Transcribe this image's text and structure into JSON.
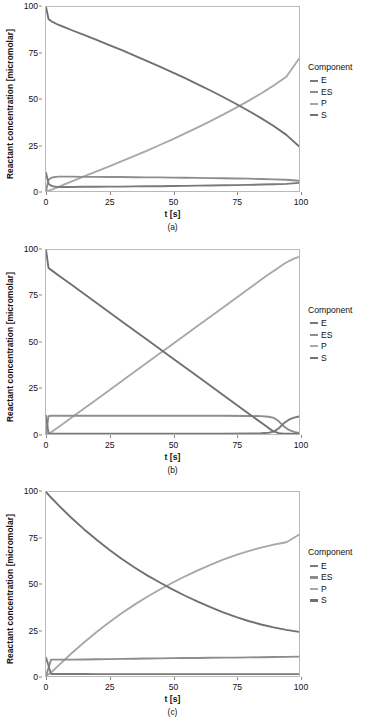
{
  "figure": {
    "panels": [
      {
        "caption": "(a)",
        "xlabel": "t [s]",
        "ylabel": "Reactant concentration [micromolar]",
        "xticks": [
          "0",
          "25",
          "50",
          "75",
          "100"
        ],
        "yticks": [
          "0",
          "25",
          "50",
          "75",
          "100"
        ],
        "legend": {
          "title": "Component",
          "items": [
            {
              "label": "E",
              "color": "#7a7a7a"
            },
            {
              "label": "ES",
              "color": "#8d8d8d"
            },
            {
              "label": "P",
              "color": "#a8a8a8"
            },
            {
              "label": "S",
              "color": "#707070"
            }
          ]
        }
      },
      {
        "caption": "(b)",
        "xlabel": "t [s]",
        "ylabel": "Reactant concentration [micromolar]",
        "xticks": [
          "0",
          "25",
          "50",
          "75",
          "100"
        ],
        "yticks": [
          "0",
          "25",
          "50",
          "75",
          "100"
        ],
        "legend": {
          "title": "Component",
          "items": [
            {
              "label": "E",
              "color": "#7a7a7a"
            },
            {
              "label": "ES",
              "color": "#8d8d8d"
            },
            {
              "label": "P",
              "color": "#a8a8a8"
            },
            {
              "label": "S",
              "color": "#707070"
            }
          ]
        }
      },
      {
        "caption": "(c)",
        "xlabel": "t [s]",
        "ylabel": "Reactant concentration [micromolar]",
        "xticks": [
          "0",
          "25",
          "50",
          "75",
          "100"
        ],
        "yticks": [
          "0",
          "25",
          "50",
          "75",
          "100"
        ],
        "legend": {
          "title": "Component",
          "items": [
            {
              "label": "E",
              "color": "#7a7a7a"
            },
            {
              "label": "ES",
              "color": "#8d8d8d"
            },
            {
              "label": "P",
              "color": "#a8a8a8"
            },
            {
              "label": "S",
              "color": "#707070"
            }
          ]
        }
      }
    ]
  },
  "chart_data": [
    {
      "type": "line",
      "title": "(a)",
      "xlabel": "t [s]",
      "ylabel": "Reactant concentration [micromolar]",
      "xlim": [
        0,
        100
      ],
      "ylim": [
        0,
        100
      ],
      "xticks": [
        0,
        25,
        50,
        75,
        100
      ],
      "yticks": [
        0,
        25,
        50,
        75,
        100
      ],
      "grid": false,
      "legend": "right",
      "legend_title": "Component",
      "x": [
        0,
        1,
        2,
        3,
        4,
        5,
        7.5,
        10,
        15,
        20,
        25,
        30,
        35,
        40,
        45,
        50,
        55,
        60,
        65,
        70,
        75,
        80,
        85,
        90,
        95,
        100
      ],
      "series": [
        {
          "name": "S",
          "color": "#707070",
          "values": [
            100,
            93.5,
            92.4,
            91.6,
            90.9,
            90.3,
            88.9,
            87.5,
            84.8,
            82.1,
            79.3,
            76.5,
            73.6,
            70.6,
            67.6,
            64.5,
            61.3,
            58.0,
            54.6,
            51.1,
            47.4,
            43.6,
            39.6,
            35.3,
            30.5,
            24.3
          ]
        },
        {
          "name": "P",
          "color": "#a8a8a8",
          "values": [
            0,
            0.2,
            0.6,
            1.1,
            1.7,
            2.3,
            3.7,
            5.1,
            7.9,
            10.6,
            13.4,
            16.2,
            19.1,
            22.0,
            25.0,
            28.1,
            31.3,
            34.6,
            38.0,
            41.5,
            45.2,
            49.0,
            53.0,
            57.3,
            62.1,
            71.9
          ]
        },
        {
          "name": "ES",
          "color": "#8d8d8d",
          "values": [
            0,
            6.1,
            7.1,
            7.5,
            7.7,
            7.8,
            7.8,
            7.8,
            7.7,
            7.7,
            7.6,
            7.6,
            7.5,
            7.4,
            7.4,
            7.3,
            7.2,
            7.1,
            7.0,
            6.9,
            6.8,
            6.7,
            6.5,
            6.3,
            6.1,
            5.6
          ]
        },
        {
          "name": "E",
          "color": "#7a7a7a",
          "values": [
            10,
            3.9,
            2.9,
            2.5,
            2.3,
            2.2,
            2.2,
            2.2,
            2.3,
            2.3,
            2.4,
            2.4,
            2.5,
            2.6,
            2.6,
            2.7,
            2.8,
            2.9,
            3.0,
            3.1,
            3.2,
            3.3,
            3.5,
            3.7,
            3.9,
            4.4
          ]
        }
      ]
    },
    {
      "type": "line",
      "title": "(b)",
      "xlabel": "t [s]",
      "ylabel": "Reactant concentration [micromolar]",
      "xlim": [
        0,
        100
      ],
      "ylim": [
        0,
        100
      ],
      "xticks": [
        0,
        25,
        50,
        75,
        100
      ],
      "yticks": [
        0,
        25,
        50,
        75,
        100
      ],
      "grid": false,
      "legend": "right",
      "legend_title": "Component",
      "x": [
        0,
        1,
        2,
        5,
        10,
        20,
        30,
        40,
        50,
        60,
        70,
        80,
        85,
        88,
        90,
        92,
        94,
        96,
        98,
        100
      ],
      "series": [
        {
          "name": "S",
          "color": "#707070",
          "values": [
            100,
            90.2,
            89.2,
            86.2,
            81.2,
            71.2,
            61.2,
            51.2,
            41.2,
            31.2,
            21.2,
            11.2,
            6.2,
            3.2,
            1.4,
            0.5,
            0.2,
            0.1,
            0.05,
            0.02
          ]
        },
        {
          "name": "P",
          "color": "#a8a8a8",
          "values": [
            0,
            0.1,
            0.9,
            3.8,
            8.8,
            18.8,
            28.8,
            38.8,
            48.8,
            58.8,
            68.8,
            78.8,
            83.8,
            86.8,
            88.6,
            90.5,
            92.4,
            94.0,
            95.3,
            96.3
          ]
        },
        {
          "name": "ES",
          "color": "#8d8d8d",
          "values": [
            0,
            9.7,
            9.9,
            9.9,
            9.9,
            9.9,
            9.9,
            9.9,
            9.9,
            9.9,
            9.9,
            9.8,
            9.7,
            9.4,
            8.8,
            6.9,
            4.2,
            2.2,
            1.1,
            0.5
          ]
        },
        {
          "name": "E",
          "color": "#7a7a7a",
          "values": [
            10,
            0.3,
            0.2,
            0.2,
            0.2,
            0.2,
            0.2,
            0.2,
            0.2,
            0.2,
            0.2,
            0.3,
            0.4,
            0.7,
            1.3,
            3.1,
            5.8,
            7.8,
            8.9,
            9.5
          ]
        }
      ]
    },
    {
      "type": "line",
      "title": "(c)",
      "xlabel": "t [s]",
      "ylabel": "Reactant concentration [micromolar]",
      "xlim": [
        0,
        100
      ],
      "ylim": [
        0,
        100
      ],
      "xticks": [
        0,
        25,
        50,
        75,
        100
      ],
      "yticks": [
        0,
        25,
        50,
        75,
        100
      ],
      "grid": false,
      "legend": "right",
      "legend_title": "Component",
      "x": [
        0,
        2,
        5,
        10,
        15,
        20,
        25,
        30,
        35,
        40,
        45,
        50,
        55,
        60,
        65,
        70,
        75,
        80,
        85,
        90,
        95,
        100
      ],
      "series": [
        {
          "name": "S",
          "color": "#707070",
          "values": [
            100,
            97.0,
            92.7,
            86.0,
            79.8,
            74.0,
            68.6,
            63.6,
            59.0,
            54.7,
            50.8,
            47.1,
            43.6,
            40.4,
            37.4,
            34.6,
            32.1,
            29.9,
            28.0,
            26.4,
            25.1,
            24.0
          ]
        },
        {
          "name": "P",
          "color": "#a8a8a8",
          "values": [
            0,
            1.9,
            5.8,
            12.2,
            18.2,
            23.9,
            29.2,
            34.2,
            38.8,
            43.1,
            47.0,
            50.7,
            54.2,
            57.4,
            60.4,
            63.2,
            65.7,
            67.9,
            69.8,
            71.4,
            72.7,
            76.8
          ]
        },
        {
          "name": "ES",
          "color": "#8d8d8d",
          "values": [
            0,
            8.9,
            8.9,
            8.9,
            9.0,
            9.1,
            9.2,
            9.3,
            9.4,
            9.5,
            9.6,
            9.7,
            9.8,
            9.8,
            9.9,
            10.0,
            10.0,
            10.1,
            10.2,
            10.3,
            10.4,
            10.5
          ]
        },
        {
          "name": "E",
          "color": "#7a7a7a",
          "values": [
            10,
            1.1,
            1.1,
            1.1,
            1.1,
            1.0,
            1.0,
            1.0,
            1.0,
            1.0,
            1.0,
            1.0,
            1.0,
            1.0,
            1.0,
            1.0,
            1.0,
            1.0,
            1.0,
            1.0,
            1.0,
            1.0
          ]
        }
      ]
    }
  ]
}
